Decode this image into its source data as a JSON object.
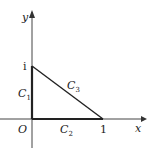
{
  "diagram": {
    "axes": {
      "x_label": "x",
      "y_label": "y",
      "origin_label": "O"
    },
    "points": {
      "i_label": "i",
      "one_label": "1"
    },
    "curves": [
      {
        "name": "C",
        "sub": "1",
        "desc": "segment from O to i"
      },
      {
        "name": "C",
        "sub": "2",
        "desc": "segment from O to 1"
      },
      {
        "name": "C",
        "sub": "3",
        "desc": "segment from 1 to i"
      }
    ],
    "colors": {
      "axis": "#333333",
      "path": "#222222"
    }
  }
}
